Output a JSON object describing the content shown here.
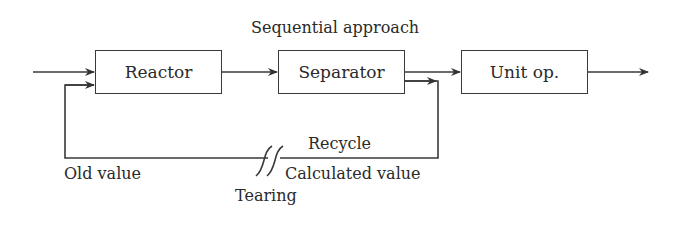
{
  "title": "Sequential approach",
  "blocks": {
    "reactor": "Reactor",
    "separator": "Separator",
    "unit_op": "Unit op."
  },
  "labels": {
    "recycle": "Recycle",
    "old_value": "Old value",
    "calculated_value": "Calculated value",
    "tearing": "Tearing"
  },
  "colors": {
    "line": "#333333",
    "text": "#2a2a2a"
  }
}
